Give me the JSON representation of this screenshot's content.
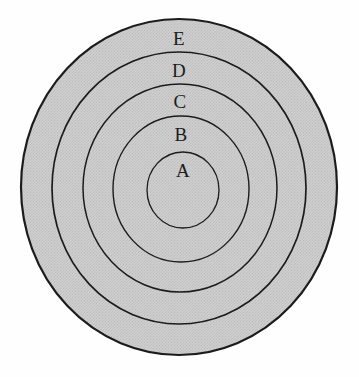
{
  "figure": {
    "background_color": "#fefefe",
    "fill_color": "#c9c9c9",
    "stroke_color": "#1c1c1c",
    "center": {
      "x": 179,
      "y": 187
    }
  },
  "chart_data": {
    "type": "pie",
    "title": "",
    "subtitle": "",
    "xlabel": "",
    "ylabel": "",
    "legend_position": "none",
    "grid": false,
    "categories": [
      "A",
      "B",
      "C",
      "D",
      "E"
    ],
    "values": [
      36,
      68,
      98,
      128,
      158
    ],
    "value_units": "radius in pixels (horizontal semi-axis)",
    "rings": [
      {
        "label": "A",
        "order": 1,
        "position": "innermost",
        "rx": 36,
        "ry": 38,
        "cx": 183,
        "cy": 190,
        "label_x": 183,
        "label_y": 173,
        "fill": "#c9c9c9",
        "stroke": "#1c1c1c"
      },
      {
        "label": "B",
        "order": 2,
        "position": "second",
        "rx": 68,
        "ry": 73,
        "cx": 181,
        "cy": 189,
        "label_x": 181,
        "label_y": 137,
        "fill": "#c9c9c9",
        "stroke": "#1c1c1c"
      },
      {
        "label": "C",
        "order": 3,
        "position": "third",
        "rx": 97,
        "ry": 104,
        "cx": 180,
        "cy": 188,
        "label_x": 180,
        "label_y": 104,
        "fill": "#c9c9c9",
        "stroke": "#1c1c1c"
      },
      {
        "label": "D",
        "order": 4,
        "position": "fourth",
        "rx": 127,
        "ry": 136,
        "cx": 179,
        "cy": 188,
        "label_x": 179,
        "label_y": 73,
        "fill": "#c9c9c9",
        "stroke": "#1c1c1c"
      },
      {
        "label": "E",
        "order": 5,
        "position": "outermost",
        "rx": 158,
        "ry": 168,
        "cx": 179,
        "cy": 187,
        "label_x": 179,
        "label_y": 41,
        "fill": "#c9c9c9",
        "stroke": "#1c1c1c"
      }
    ]
  },
  "labels": {
    "e": "E",
    "d": "D",
    "c": "C",
    "b": "B",
    "a": "A"
  }
}
